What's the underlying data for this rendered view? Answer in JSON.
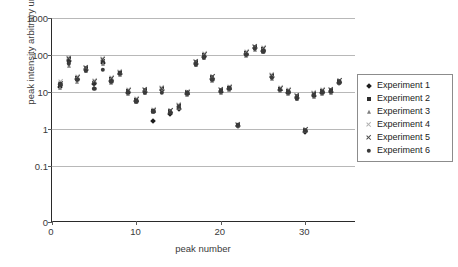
{
  "chart_data": {
    "type": "scatter",
    "title": "",
    "xlabel": "peak number",
    "ylabel": "peak intensity arbitrary units",
    "xlim": [
      0,
      36
    ],
    "ylim_log": [
      0.1,
      1000
    ],
    "yscale": "log",
    "grid": true,
    "legend_position": "right",
    "y_ticks": [
      "1000",
      "100",
      "10",
      "1",
      "0.1",
      "0"
    ],
    "y_tick_values": [
      1000,
      100,
      10,
      1,
      0.1,
      0
    ],
    "x_ticks": [
      "0",
      "10",
      "20",
      "30"
    ],
    "x_tick_values": [
      0,
      10,
      20,
      30
    ],
    "x": [
      1,
      2,
      3,
      4,
      5,
      6,
      7,
      8,
      9,
      10,
      11,
      12,
      13,
      14,
      15,
      16,
      17,
      18,
      19,
      20,
      21,
      22,
      23,
      24,
      25,
      26,
      27,
      28,
      29,
      30,
      31,
      32,
      33,
      34
    ],
    "series": [
      {
        "name": "Experiment 1",
        "marker": "diamond",
        "color": "#1c1c1c",
        "values": [
          14,
          70,
          22,
          40,
          16,
          62,
          20,
          31,
          9.5,
          5.8,
          9.8,
          1.6,
          11,
          2.6,
          3.4,
          9.0,
          58,
          90,
          22,
          10,
          12,
          1.2,
          105,
          150,
          130,
          25,
          11,
          9.5,
          7.0,
          0.82,
          8.0,
          9.5,
          10,
          18
        ]
      },
      {
        "name": "Experiment 2",
        "marker": "square",
        "color": "#2d2d2d",
        "values": [
          15,
          76,
          24,
          44,
          18,
          70,
          22,
          33,
          10.5,
          6.2,
          11,
          3.1,
          12,
          3.0,
          4.2,
          9.8,
          64,
          100,
          25,
          11,
          13,
          1.3,
          115,
          165,
          145,
          27,
          12,
          10.5,
          7.6,
          0.95,
          8.8,
          10.5,
          11,
          20
        ]
      },
      {
        "name": "Experiment 3",
        "marker": "triangle",
        "color": "#7d7d7d",
        "values": [
          13,
          52,
          19,
          36,
          14,
          56,
          18,
          29,
          8.8,
          5.4,
          9.2,
          2.9,
          10.5,
          2.8,
          3.8,
          8.4,
          54,
          84,
          20,
          9.5,
          11,
          1.2,
          96,
          140,
          120,
          23,
          10.5,
          8.8,
          6.5,
          0.88,
          7.4,
          8.8,
          9.4,
          17
        ]
      },
      {
        "name": "Experiment 4",
        "marker": "x-light",
        "color": "#b0b0b0",
        "values": [
          19,
          84,
          26,
          47,
          20,
          78,
          24,
          35,
          11.5,
          6.6,
          12,
          3.3,
          13,
          3.2,
          4.6,
          10.5,
          68,
          108,
          27,
          12,
          14,
          1.35,
          125,
          175,
          155,
          29,
          13,
          11.5,
          8.2,
          1.0,
          9.4,
          11.5,
          12,
          21
        ]
      },
      {
        "name": "Experiment 5",
        "marker": "x",
        "color": "#4a4a4a",
        "values": [
          17,
          80,
          25,
          45,
          19,
          74,
          23,
          34,
          11,
          6.4,
          11.5,
          3.2,
          12.5,
          3.1,
          4.4,
          10,
          66,
          104,
          26,
          11.5,
          13.5,
          1.3,
          120,
          170,
          150,
          28,
          12.5,
          11,
          7.9,
          0.97,
          9.1,
          11,
          11.5,
          20.5
        ]
      },
      {
        "name": "Experiment 6",
        "marker": "circle",
        "color": "#3a3a3a",
        "values": [
          16,
          60,
          21,
          38,
          12,
          40,
          19,
          32,
          9.8,
          5.6,
          9.5,
          3.0,
          9.6,
          2.7,
          4.0,
          9.2,
          56,
          86,
          21,
          10.5,
          12.5,
          1.25,
          100,
          145,
          125,
          24,
          11.5,
          9.8,
          6.8,
          0.9,
          8.2,
          9.8,
          10.5,
          18.5
        ]
      }
    ]
  }
}
